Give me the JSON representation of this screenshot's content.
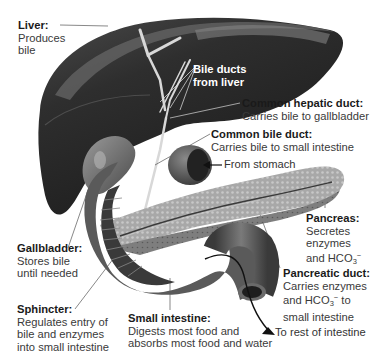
{
  "diagram": {
    "type": "anatomical-illustration",
    "colors": {
      "liver": "#2b2b2b",
      "liver_highlight": "#5a5a5a",
      "ducts": "#d9d9d9",
      "gallbladder": "#6a6a6a",
      "pancreas": "#9c9c9c",
      "intestine": "#555555",
      "label_text": "#333333",
      "leader_line": "#555555"
    }
  },
  "labels": {
    "liver": {
      "title": "Liver:",
      "desc": [
        "Produces",
        "bile"
      ]
    },
    "bile_ducts": {
      "title": [
        "Bile ducts",
        "from liver"
      ]
    },
    "common_hepatic_duct": {
      "title": "Common hepatic duct:",
      "desc": [
        "Carries bile to gallbladder"
      ]
    },
    "common_bile_duct": {
      "title": "Common bile duct:",
      "desc": [
        "Carries bile to small intestine"
      ]
    },
    "from_stomach": {
      "text": "From stomach"
    },
    "pancreas": {
      "title": "Pancreas:",
      "desc": [
        "Secretes",
        "enzymes",
        "and HCO"
      ],
      "subscript": "3",
      "superscript": "−"
    },
    "gallbladder": {
      "title": "Gallbladder:",
      "desc": [
        "Stores bile",
        "until needed"
      ]
    },
    "pancreatic_duct": {
      "title": "Pancreatic duct:",
      "desc": [
        "Carries enzymes",
        "and HCO",
        " to",
        "small intestine"
      ],
      "subscript": "3",
      "superscript": "−"
    },
    "sphincter": {
      "title": "Sphincter:",
      "desc": [
        "Regulates entry of",
        "bile and enzymes",
        "into small intestine"
      ]
    },
    "small_intestine": {
      "title": "Small intestine:",
      "desc": [
        "Digests most food and",
        "absorbs most food and water"
      ]
    },
    "to_rest": {
      "text": "To rest of intestine"
    }
  }
}
